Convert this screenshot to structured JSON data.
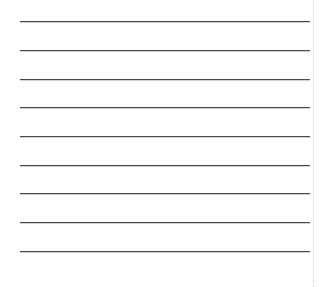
{
  "sheet": {
    "type": "lined-paper",
    "line_count": 9,
    "line_color": "#4a4a4a",
    "lines_y": [
      21,
      50,
      79,
      107,
      136,
      165,
      193,
      222,
      251
    ],
    "margin_guide": "dotted-vertical",
    "margin_color": "#cfcfcf"
  }
}
